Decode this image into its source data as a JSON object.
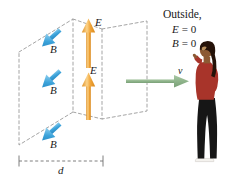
{
  "figure": {
    "background_color": "#ffffff",
    "width": 237,
    "height": 181
  },
  "colors": {
    "E_arrow": "#F2A73B",
    "E_arrow_light": "#FBD38A",
    "B_arrow": "#2E9BD6",
    "B_arrow_light": "#7FC8EC",
    "velocity_arrow": "#8FB48B",
    "dashed_plane": "#9a9a9a",
    "text": "#1a1a1a",
    "person_shirt": "#A8342A",
    "person_pants": "#161616",
    "person_hair": "#241208",
    "person_skin": "#8C5A33",
    "person_shoes": "#F2F0EC"
  },
  "labels": {
    "B_field_1": "B",
    "B_field_2": "B",
    "B_field_3": "B",
    "E_field_1": "E",
    "E_field_2": "E",
    "velocity": "v",
    "thickness": "d"
  },
  "annotation": {
    "outside_title": "Outside,",
    "outside_E_var": "E",
    "outside_E_rel": "= 0",
    "outside_B_var": "B",
    "outside_B_rel": "= 0",
    "outside_E_full": "E = 0",
    "outside_B_full": "B = 0"
  },
  "icons": {
    "e_field_arrow": "arrow-up-icon",
    "b_field_arrow": "arrow-down-left-icon",
    "velocity_arrow": "arrow-right-icon",
    "dimension_line": "dimension-line-icon",
    "observer": "person-shielding-eyes-icon"
  },
  "geometry": {
    "front_plane": [
      [
        19,
        52
      ],
      [
        73,
        19
      ],
      [
        73,
        112
      ],
      [
        19,
        145
      ]
    ],
    "back_plane": [
      [
        102,
        29
      ],
      [
        147,
        21
      ],
      [
        147,
        111
      ],
      [
        102,
        119
      ]
    ],
    "dimension_line": {
      "x1": 19,
      "x2": 103,
      "y": 161
    }
  }
}
